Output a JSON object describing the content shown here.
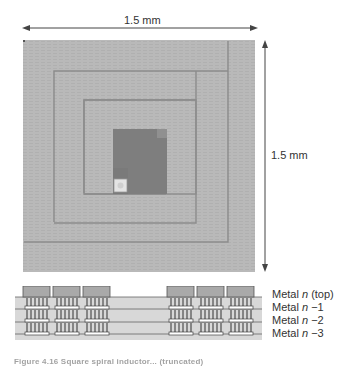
{
  "top_view": {
    "width_label": "1.5 mm",
    "height_label": "1.5 mm",
    "colors": {
      "background": "#b8b8b8",
      "trace_line": "#8a8a8a",
      "center_pad": "#7c7c7c",
      "via": "#e2e2e2"
    }
  },
  "cross_section": {
    "layers": [
      {
        "label_prefix": "Metal ",
        "label_var": "n",
        "label_suffix": " (top)"
      },
      {
        "label_prefix": "Metal ",
        "label_var": "n",
        "label_suffix": " −1"
      },
      {
        "label_prefix": "Metal ",
        "label_var": "n",
        "label_suffix": " −2"
      },
      {
        "label_prefix": "Metal ",
        "label_var": "n",
        "label_suffix": " −3"
      }
    ],
    "colors": {
      "band": "#d6d6d6",
      "conductor": "#a8a8a8",
      "outline": "#555555"
    }
  },
  "caption": {
    "text": "Figure 4.16  Square spiral inductor... (truncated)"
  }
}
